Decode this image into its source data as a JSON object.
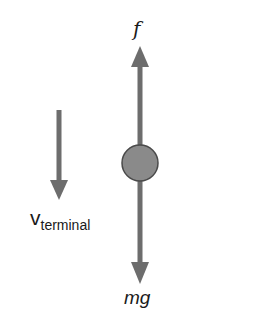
{
  "diagram": {
    "colors": {
      "arrow": "#6d6d6d",
      "ball_fill": "#8a8a8a",
      "ball_stroke": "#4a4a4a",
      "text": "#1a1a1a",
      "background": "#ffffff"
    },
    "labels": {
      "upward_force": "f",
      "downward_force": "mg",
      "velocity_symbol": "v",
      "velocity_subscript": "terminal"
    },
    "elements": {
      "upward_arrow": {
        "label": "f",
        "direction": "up"
      },
      "downward_arrow": {
        "label": "mg",
        "direction": "down"
      },
      "velocity_arrow": {
        "label": "v_terminal",
        "direction": "down"
      },
      "object": {
        "shape": "circle"
      }
    }
  }
}
